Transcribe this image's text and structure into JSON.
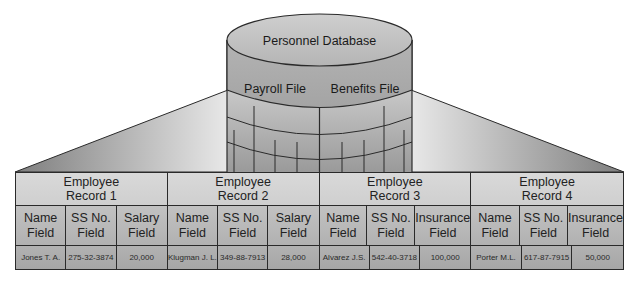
{
  "database": {
    "title": "Personnel Database",
    "files": [
      "Payroll File",
      "Benefits File"
    ]
  },
  "colors": {
    "cylinder_top": "#c4c4c4",
    "cylinder_band": "#a9a9a9",
    "cone_dark": "#8a8a8a",
    "cone_light": "#e6e6e6",
    "outline": "#2a2a2a"
  },
  "records": [
    {
      "title": "Employee Record 1",
      "title_lines": [
        "Employee",
        "Record 1"
      ],
      "fields": [
        {
          "label_lines": [
            "Name",
            "Field"
          ],
          "value": "Jones T. A."
        },
        {
          "label_lines": [
            "SS No.",
            "Field"
          ],
          "value": "275-32-3874"
        },
        {
          "label_lines": [
            "Salary",
            "Field"
          ],
          "value": "20,000"
        }
      ]
    },
    {
      "title": "Employee Record 2",
      "title_lines": [
        "Employee",
        "Record 2"
      ],
      "fields": [
        {
          "label_lines": [
            "Name",
            "Field"
          ],
          "value": "Klugman J. L."
        },
        {
          "label_lines": [
            "SS No.",
            "Field"
          ],
          "value": "349-88-7913"
        },
        {
          "label_lines": [
            "Salary",
            "Field"
          ],
          "value": "28,000"
        }
      ]
    },
    {
      "title": "Employee Record 3",
      "title_lines": [
        "Employee",
        "Record 3"
      ],
      "fields": [
        {
          "label_lines": [
            "Name",
            "Field"
          ],
          "value": "Alvarez J.S."
        },
        {
          "label_lines": [
            "SS No.",
            "Field"
          ],
          "value": "542-40-3718"
        },
        {
          "label_lines": [
            "Insurance",
            "Field"
          ],
          "value": "100,000"
        }
      ]
    },
    {
      "title": "Employee Record 4",
      "title_lines": [
        "Employee",
        "Record 4"
      ],
      "fields": [
        {
          "label_lines": [
            "Name",
            "Field"
          ],
          "value": "Porter M.L."
        },
        {
          "label_lines": [
            "SS No.",
            "Field"
          ],
          "value": "617-87-7915"
        },
        {
          "label_lines": [
            "Insurance",
            "Field"
          ],
          "value": "50,000"
        }
      ]
    }
  ]
}
